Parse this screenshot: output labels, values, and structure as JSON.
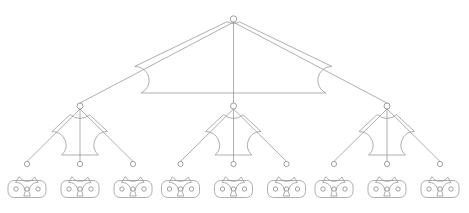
{
  "diagram": {
    "type": "tree",
    "canvas": {
      "width": 469,
      "height": 213
    },
    "style": {
      "background_color": "#ffffff",
      "line_color": "#8c8c8c",
      "node_stroke_color": "#7a7a7a",
      "node_fill_color": "#ffffff",
      "line_width": 0.7,
      "corner_radius": 14
    },
    "levels": [
      {
        "index": 0,
        "name": "root",
        "node_count": 1,
        "node_radius": 3.2,
        "baseline_y": 93
      },
      {
        "index": 1,
        "name": "branch",
        "node_count": 3,
        "node_radius": 3.0,
        "baseline_y": 155
      },
      {
        "index": 2,
        "name": "leaf",
        "node_count": 9,
        "node_radius": 2.6,
        "baseline_y": 196
      },
      {
        "index": 3,
        "name": "terminal",
        "node_count": 27,
        "node_radius": 2.2,
        "baseline_y": 196
      }
    ],
    "root": {
      "label": "root-node",
      "apex": {
        "x": 233.5,
        "y": 19
      },
      "baseline": {
        "y": 93,
        "x_left": 80,
        "x_right": 387
      }
    },
    "branches": [
      {
        "label": "branch-node-1",
        "apex": {
          "x": 80,
          "y": 106
        },
        "baseline": {
          "y": 155,
          "x_left": 27,
          "x_right": 133
        }
      },
      {
        "label": "branch-node-2",
        "apex": {
          "x": 233.5,
          "y": 106
        },
        "baseline": {
          "y": 155,
          "x_left": 180.5,
          "x_right": 286.5
        }
      },
      {
        "label": "branch-node-3",
        "apex": {
          "x": 387,
          "y": 106
        },
        "baseline": {
          "y": 155,
          "x_left": 334,
          "x_right": 440
        }
      }
    ],
    "leaves": [
      {
        "label": "leaf-node-1",
        "apex": {
          "x": 27,
          "y": 164
        },
        "baseline": {
          "y": 196,
          "x_left": 8,
          "x_right": 46
        }
      },
      {
        "label": "leaf-node-2",
        "apex": {
          "x": 80,
          "y": 164
        },
        "baseline": {
          "y": 196,
          "x_left": 61,
          "x_right": 99
        }
      },
      {
        "label": "leaf-node-3",
        "apex": {
          "x": 133,
          "y": 164
        },
        "baseline": {
          "y": 196,
          "x_left": 114,
          "x_right": 152
        }
      },
      {
        "label": "leaf-node-4",
        "apex": {
          "x": 180.5,
          "y": 164
        },
        "baseline": {
          "y": 196,
          "x_left": 161.5,
          "x_right": 199.5
        }
      },
      {
        "label": "leaf-node-5",
        "apex": {
          "x": 233.5,
          "y": 164
        },
        "baseline": {
          "y": 196,
          "x_left": 214.5,
          "x_right": 252.5
        }
      },
      {
        "label": "leaf-node-6",
        "apex": {
          "x": 286.5,
          "y": 164
        },
        "baseline": {
          "y": 196,
          "x_left": 267.5,
          "x_right": 305.5
        }
      },
      {
        "label": "leaf-node-7",
        "apex": {
          "x": 334,
          "y": 164
        },
        "baseline": {
          "y": 196,
          "x_left": 315,
          "x_right": 353
        }
      },
      {
        "label": "leaf-node-8",
        "apex": {
          "x": 387,
          "y": 164
        },
        "baseline": {
          "y": 196,
          "x_left": 368,
          "x_right": 406
        }
      },
      {
        "label": "leaf-node-9",
        "apex": {
          "x": 440,
          "y": 164
        },
        "baseline": {
          "y": 196,
          "x_left": 421,
          "x_right": 459
        }
      }
    ],
    "terminal_groups": [
      {
        "label": "terminal-group-1",
        "center_x": 27,
        "center_y": 187.5,
        "dot_offsets": [
          -11,
          0,
          11
        ]
      },
      {
        "label": "terminal-group-2",
        "center_x": 80,
        "center_y": 187.5,
        "dot_offsets": [
          -11,
          0,
          11
        ]
      },
      {
        "label": "terminal-group-3",
        "center_x": 133,
        "center_y": 187.5,
        "dot_offsets": [
          -11,
          0,
          11
        ]
      },
      {
        "label": "terminal-group-4",
        "center_x": 180.5,
        "center_y": 187.5,
        "dot_offsets": [
          -11,
          0,
          11
        ]
      },
      {
        "label": "terminal-group-5",
        "center_x": 233.5,
        "center_y": 187.5,
        "dot_offsets": [
          -11,
          0,
          11
        ]
      },
      {
        "label": "terminal-group-6",
        "center_x": 286.5,
        "center_y": 187.5,
        "dot_offsets": [
          -11,
          0,
          11
        ]
      },
      {
        "label": "terminal-group-7",
        "center_x": 334,
        "center_y": 187.5,
        "dot_offsets": [
          -11,
          0,
          11
        ]
      },
      {
        "label": "terminal-group-8",
        "center_x": 387,
        "center_y": 187.5,
        "dot_offsets": [
          -11,
          0,
          11
        ]
      },
      {
        "label": "terminal-group-9",
        "center_x": 440,
        "center_y": 187.5,
        "dot_offsets": [
          -11,
          0,
          11
        ]
      }
    ]
  }
}
